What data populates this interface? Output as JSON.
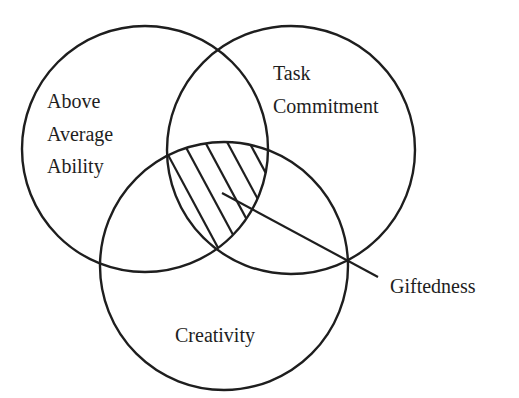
{
  "diagram": {
    "type": "venn",
    "stroke_color": "#1e1e1e",
    "background": "#ffffff",
    "circles": [
      {
        "id": "ability",
        "label_lines": [
          "Above",
          "Average",
          "Ability"
        ],
        "cx": 145,
        "cy": 149,
        "r": 123
      },
      {
        "id": "task",
        "label_lines": [
          "Task",
          "Commitment"
        ],
        "cx": 291,
        "cy": 150,
        "r": 124
      },
      {
        "id": "creativity",
        "label_lines": [
          "Creativity"
        ],
        "cx": 224,
        "cy": 266,
        "r": 124
      }
    ],
    "intersection": {
      "label": "Giftedness",
      "fill": "hatched",
      "pointer": {
        "x1": 222,
        "y1": 193,
        "x2": 378,
        "y2": 277
      }
    }
  }
}
